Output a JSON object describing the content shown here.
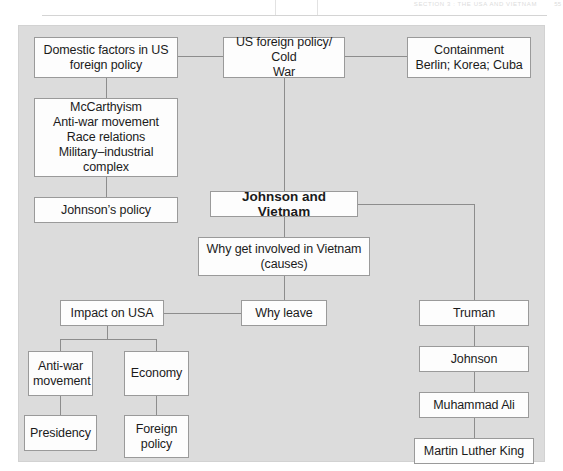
{
  "page_header": {
    "text": "SECTION 3 : THE USA AND VIETNAM",
    "page_number": "55"
  },
  "diagram": {
    "type": "flowchart",
    "title": "Johnson and Vietnam",
    "background_color": "#dcdcdc",
    "box_fill_color": "#fdfdfd",
    "box_border_color": "#9a9a9a",
    "connector_color": "#8d8d8d",
    "nodes": [
      {
        "id": "domestic-factors",
        "label": "Domestic factors in US\nforeign policy"
      },
      {
        "id": "us-foreign-policy",
        "label": "US foreign policy/ Cold\nWar"
      },
      {
        "id": "containment",
        "label": "Containment\nBerlin; Korea; Cuba"
      },
      {
        "id": "mccarthyism",
        "label": "McCarthyism\nAnti-war movement\nRace relations\nMilitary–industrial\ncomplex"
      },
      {
        "id": "johnsons-policy",
        "label": "Johnson’s policy"
      },
      {
        "id": "johnson-vietnam",
        "label": "Johnson and Vietnam",
        "bold": true
      },
      {
        "id": "why-involved",
        "label": "Why get involved in Vietnam\n(causes)"
      },
      {
        "id": "impact-usa",
        "label": "Impact on USA"
      },
      {
        "id": "why-leave",
        "label": "Why leave"
      },
      {
        "id": "truman",
        "label": "Truman"
      },
      {
        "id": "johnson",
        "label": "Johnson"
      },
      {
        "id": "muhammad-ali",
        "label": "Muhammad Ali"
      },
      {
        "id": "martin-luther-king",
        "label": "Martin Luther King"
      },
      {
        "id": "anti-war-movement",
        "label": "Anti-war\nmovement"
      },
      {
        "id": "economy",
        "label": "Economy"
      },
      {
        "id": "presidency",
        "label": "Presidency"
      },
      {
        "id": "foreign-policy",
        "label": "Foreign\npolicy"
      }
    ],
    "edges": [
      {
        "from": "domestic-factors",
        "to": "us-foreign-policy"
      },
      {
        "from": "us-foreign-policy",
        "to": "containment"
      },
      {
        "from": "domestic-factors",
        "to": "mccarthyism"
      },
      {
        "from": "mccarthyism",
        "to": "johnsons-policy"
      },
      {
        "from": "us-foreign-policy",
        "to": "johnson-vietnam"
      },
      {
        "from": "johnson-vietnam",
        "to": "why-involved"
      },
      {
        "from": "why-involved",
        "to": "why-leave"
      },
      {
        "from": "why-leave",
        "to": "impact-usa"
      },
      {
        "from": "johnson-vietnam",
        "to": "truman"
      },
      {
        "from": "truman",
        "to": "johnson"
      },
      {
        "from": "johnson",
        "to": "muhammad-ali"
      },
      {
        "from": "muhammad-ali",
        "to": "martin-luther-king"
      },
      {
        "from": "impact-usa",
        "to": "anti-war-movement"
      },
      {
        "from": "impact-usa",
        "to": "economy"
      },
      {
        "from": "anti-war-movement",
        "to": "presidency"
      },
      {
        "from": "economy",
        "to": "foreign-policy"
      }
    ]
  }
}
